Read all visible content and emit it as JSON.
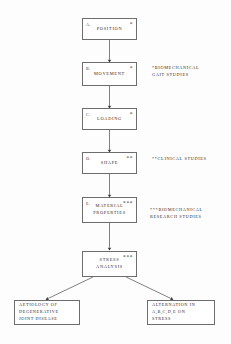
{
  "diagram": {
    "type": "flowchart",
    "background_color": "#fdfdfd",
    "line_color": "#4a4a4a",
    "box_border_color": "#6d6d6d",
    "nodes": [
      {
        "id": "position",
        "index": "A.",
        "label": "POSITION",
        "marker": "*"
      },
      {
        "id": "movement",
        "index": "B.",
        "label": "MOVEMENT",
        "marker": "*"
      },
      {
        "id": "loading",
        "index": "C.",
        "label": "LOADING",
        "marker": "*"
      },
      {
        "id": "shape",
        "index": "D.",
        "label": "SHAPE",
        "marker": "**"
      },
      {
        "id": "material_properties",
        "index": "E.",
        "label": "MATERIAL\nPROPERTIES",
        "marker": "***"
      },
      {
        "id": "stress_analysis",
        "index": "",
        "label": "STRESS\nANALYSIS",
        "marker": "***"
      }
    ],
    "annotations": [
      {
        "id": "gait_studies",
        "text": "*BIOMECHANICAL\n GAIT STUDIES"
      },
      {
        "id": "clinical_studies",
        "text": "**CLINICAL STUDIES"
      },
      {
        "id": "research_studies",
        "text": "***BIOMECHANICAL\n  RESEARCH STUDIES"
      }
    ],
    "outcomes": [
      {
        "id": "aetiology",
        "text": "AETIOLOGY OF\nDEGENERATIVE\nJOINT DISEASE"
      },
      {
        "id": "alternation",
        "text": "ALTERNATION IN\nA,B,C,D,E ON\nSTRESS"
      }
    ]
  }
}
